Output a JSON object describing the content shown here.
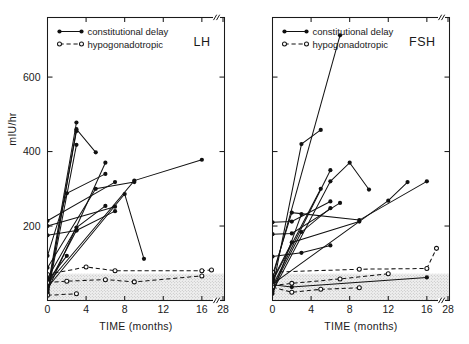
{
  "figure": {
    "xlabel": "TIME (months)",
    "ylabel": "mIU/hr"
  },
  "legend": {
    "items": [
      {
        "label": "constitutional delay",
        "style": "solid-filled"
      },
      {
        "label": "hypogonadotropic",
        "style": "dashed-open"
      }
    ]
  },
  "axes": {
    "x_ticks": [
      "0",
      "4",
      "8",
      "12",
      "16",
      "28"
    ],
    "y_ticks_labeled": [
      "200",
      "400",
      "600"
    ],
    "x_break_between": [
      "16",
      "28"
    ]
  },
  "chart_data": {
    "type": "line",
    "title": "",
    "xlabel": "TIME (months)",
    "ylabel": "mIU/hr",
    "xlim": [
      0,
      28
    ],
    "ylim": [
      0,
      760
    ],
    "x_ticks": [
      0,
      4,
      8,
      12,
      16,
      28
    ],
    "y_ticks": [
      200,
      400,
      600
    ],
    "grid": false,
    "legend_position": "top-left",
    "axis_break_x": [
      17,
      27
    ],
    "panels": [
      {
        "name": "LH",
        "shaded_band": {
          "label": "prepubertal range",
          "y_from": 0,
          "y_to": 72,
          "color": "#e3e3e3"
        },
        "series": [
          {
            "name": "constitutional delay",
            "style": "solid-filled",
            "subjects": [
              {
                "x": [
                  0,
                  3
                ],
                "y": [
                  30,
                  478
                ]
              },
              {
                "x": [
                  0,
                  3,
                  5
                ],
                "y": [
                  18,
                  460,
                  398
                ]
              },
              {
                "x": [
                  0,
                  3
                ],
                "y": [
                  22,
                  455
                ]
              },
              {
                "x": [
                  0,
                  3
                ],
                "y": [
                  14,
                  418
                ]
              },
              {
                "x": [
                  0,
                  6
                ],
                "y": [
                  26,
                  370
                ]
              },
              {
                "x": [
                  0,
                  2,
                  6
                ],
                "y": [
                  120,
                  288,
                  340
                ]
              },
              {
                "x": [
                  0,
                  5,
                  9
                ],
                "y": [
                  88,
                  300,
                  318
                ]
              },
              {
                "x": [
                  0,
                  9,
                  16
                ],
                "y": [
                  45,
                  322,
                  378
                ]
              },
              {
                "x": [
                  0,
                  7
                ],
                "y": [
                  214,
                  318
                ]
              },
              {
                "x": [
                  0,
                  7
                ],
                "y": [
                  200,
                  252
                ]
              },
              {
                "x": [
                  0,
                  3,
                  6
                ],
                "y": [
                  60,
                  196,
                  254
                ]
              },
              {
                "x": [
                  0,
                  8,
                  10
                ],
                "y": [
                  35,
                  286,
                  112
                ]
              },
              {
                "x": [
                  0,
                  3,
                  7
                ],
                "y": [
                  40,
                  188,
                  240
                ]
              },
              {
                "x": [
                  0,
                  3
                ],
                "y": [
                  175,
                  188
                ]
              },
              {
                "x": [
                  0,
                  2
                ],
                "y": [
                  52,
                  120
                ]
              }
            ]
          },
          {
            "name": "hypogonadotropic",
            "style": "dashed-open",
            "subjects": [
              {
                "x": [
                  0,
                  4,
                  7,
                  16,
                  17
                ],
                "y": [
                  70,
                  90,
                  80,
                  80,
                  82
                ]
              },
              {
                "x": [
                  0,
                  2,
                  6,
                  9,
                  16
                ],
                "y": [
                  48,
                  52,
                  56,
                  50,
                  66
                ]
              },
              {
                "x": [
                  0,
                  3
                ],
                "y": [
                  14,
                  18
                ]
              }
            ]
          }
        ]
      },
      {
        "name": "FSH",
        "shaded_band": {
          "label": "prepubertal range",
          "y_from": 0,
          "y_to": 72,
          "color": "#e3e3e3"
        },
        "series": [
          {
            "name": "constitutional delay",
            "style": "solid-filled",
            "subjects": [
              {
                "x": [
                  0,
                  7
                ],
                "y": [
                  60,
                  712
                ]
              },
              {
                "x": [
                  0,
                  3,
                  5
                ],
                "y": [
                  30,
                  420,
                  458
                ]
              },
              {
                "x": [
                  0,
                  6,
                  8,
                  10
                ],
                "y": [
                  24,
                  320,
                  370,
                  298
                ]
              },
              {
                "x": [
                  0,
                  6
                ],
                "y": [
                  38,
                  350
                ]
              },
              {
                "x": [
                  0,
                  5
                ],
                "y": [
                  52,
                  300
                ]
              },
              {
                "x": [
                  0,
                  12,
                  14
                ],
                "y": [
                  44,
                  268,
                  318
                ]
              },
              {
                "x": [
                  0,
                  2,
                  9,
                  16
                ],
                "y": [
                  68,
                  236,
                  216,
                  320
                ]
              },
              {
                "x": [
                  0,
                  3
                ],
                "y": [
                  18,
                  232
                ]
              },
              {
                "x": [
                  0,
                  2,
                  6
                ],
                "y": [
                  210,
                  212,
                  266
                ]
              },
              {
                "x": [
                  0,
                  2,
                  7
                ],
                "y": [
                  178,
                  180,
                  262
                ]
              },
              {
                "x": [
                  0,
                  3,
                  6
                ],
                "y": [
                  32,
                  184,
                  248
                ]
              },
              {
                "x": [
                  0,
                  2,
                  9
                ],
                "y": [
                  56,
                  156,
                  212
                ]
              },
              {
                "x": [
                  0,
                  3,
                  6
                ],
                "y": [
                  118,
                  128,
                  148
                ]
              },
              {
                "x": [
                  0,
                  2,
                  16
                ],
                "y": [
                  42,
                  36,
                  62
                ]
              }
            ]
          },
          {
            "name": "hypogonadotropic",
            "style": "dashed-open",
            "subjects": [
              {
                "x": [
                  0,
                  9,
                  16,
                  17
                ],
                "y": [
                  76,
                  84,
                  86,
                  140
                ]
              },
              {
                "x": [
                  0,
                  2,
                  7,
                  12
                ],
                "y": [
                  40,
                  46,
                  58,
                  72
                ]
              },
              {
                "x": [
                  0,
                  2,
                  5,
                  9
                ],
                "y": [
                  36,
                  22,
                  30,
                  34
                ]
              }
            ]
          }
        ]
      }
    ]
  }
}
